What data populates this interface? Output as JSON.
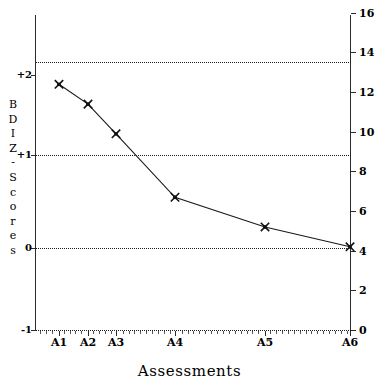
{
  "chart_data": {
    "type": "line",
    "title": "",
    "xlabel": "Assessments",
    "ylabel": "BDI Z-Scores",
    "categories": [
      "A1",
      "A2",
      "A3",
      "A4",
      "A5",
      "A6"
    ],
    "x_positions": [
      59,
      88,
      116,
      175,
      265,
      350
    ],
    "series": [
      {
        "name": "BDI",
        "values": [
          12.4,
          11.4,
          9.9,
          6.7,
          5.2,
          4.2
        ],
        "z_values": [
          1.87,
          1.64,
          1.33,
          0.61,
          0.25,
          0.02
        ],
        "marker": "cross",
        "color": "#1a1a1a"
      }
    ],
    "left_axis": {
      "label": "BDI Z-Scores",
      "ticks": [
        "+2",
        "+1",
        "0",
        "-1"
      ],
      "tick_values": [
        2,
        1,
        0,
        -1
      ],
      "tick_pixels": [
        75,
        155,
        248,
        330
      ],
      "ylim": [
        -1,
        2.2
      ]
    },
    "right_axis": {
      "ticks": [
        "16",
        "14",
        "12",
        "10",
        "8",
        "6",
        "4",
        "2",
        "0"
      ],
      "tick_values": [
        16,
        14,
        12,
        10,
        8,
        6,
        4,
        2,
        0
      ],
      "ylim": [
        0,
        16
      ]
    },
    "gridlines": {
      "visible": true,
      "style": "dotted",
      "y_values": [
        13.5,
        9.0,
        4.35
      ],
      "y_pixels": [
        62,
        155,
        248
      ]
    },
    "legend": {
      "visible": false,
      "position": "none"
    },
    "grid": true
  },
  "axis_titles": {
    "x": "Assessments",
    "y_letters": [
      "B",
      "D",
      "I",
      "Z",
      "-",
      "S",
      "c",
      "o",
      "r",
      "e",
      "s"
    ]
  },
  "colors": {
    "axis": "#2b2b2b",
    "line": "#1a1a1a",
    "grid": "#1a1a1a",
    "background": "#ffffff"
  }
}
